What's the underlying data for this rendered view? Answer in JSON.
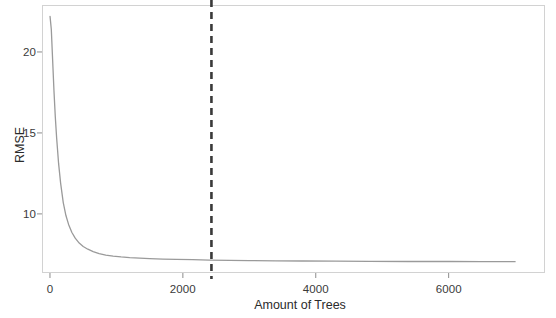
{
  "chart_data": {
    "type": "line",
    "title": "",
    "subtitle": "",
    "xlabel": "Amount of Trees",
    "ylabel": "RMSE",
    "xlim": [
      -120,
      7450
    ],
    "ylim": [
      6.35,
      22.9
    ],
    "xticks": [
      0,
      2000,
      4000,
      6000
    ],
    "xticklabels": [
      "0",
      "2000",
      "4000",
      "6000"
    ],
    "yticks": [
      10,
      15,
      20
    ],
    "yticklabels": [
      "10",
      "15",
      "20"
    ],
    "grid": false,
    "legend": null,
    "series": [
      {
        "name": "RMSE",
        "color": "#9a9a9a",
        "linewidth": 1.3,
        "linestyle": "solid",
        "x": [
          1,
          20,
          40,
          60,
          80,
          100,
          130,
          160,
          200,
          240,
          280,
          330,
          380,
          440,
          500,
          570,
          650,
          740,
          840,
          950,
          1070,
          1200,
          1350,
          1500,
          1700,
          1900,
          2150,
          2400,
          2700,
          3000,
          3400,
          3800,
          4300,
          4800,
          5400,
          6000,
          6500,
          7000
        ],
        "y": [
          22.2,
          21.4,
          19.5,
          17.6,
          16.0,
          14.7,
          13.1,
          11.9,
          10.7,
          9.9,
          9.35,
          8.85,
          8.5,
          8.2,
          7.99,
          7.82,
          7.67,
          7.55,
          7.46,
          7.39,
          7.34,
          7.3,
          7.27,
          7.24,
          7.21,
          7.19,
          7.17,
          7.15,
          7.13,
          7.12,
          7.1,
          7.09,
          7.08,
          7.07,
          7.06,
          7.06,
          7.05,
          7.05
        ]
      }
    ],
    "annotations": [
      {
        "name": "optimal-trees-marker",
        "type": "vline",
        "x": 2430,
        "color": "#3a3a3a",
        "linestyle": "dashed",
        "linewidth": 2.6,
        "label": ""
      }
    ],
    "panel": {
      "border_color": "#d2d2d2",
      "background": "#ffffff"
    }
  }
}
